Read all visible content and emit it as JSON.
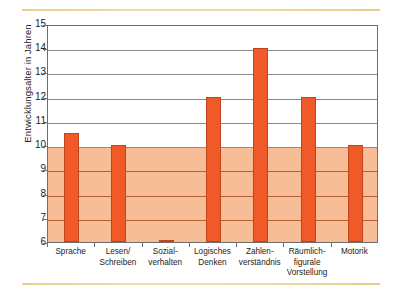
{
  "chart_data": {
    "type": "bar",
    "title": "",
    "xlabel": "",
    "ylabel": "Entwicklungsalter in Jahren",
    "ylim": [
      6,
      15
    ],
    "yticks": [
      6,
      7,
      8,
      9,
      10,
      11,
      12,
      13,
      14,
      15
    ],
    "grid": true,
    "legend": "none",
    "shaded_band": {
      "from": 6,
      "to": 10,
      "color": "#f7bd96"
    },
    "bar_color": "#ef5a28",
    "bar_edge_color": "#c0451c",
    "categories": [
      "Sprache",
      "Lesen/ Schreiben",
      "Sozial- verhalten",
      "Logisches Denken",
      "Zahlen- verständnis",
      "Räumlich- figurale Vorstellung",
      "Motorik"
    ],
    "category_lines": [
      [
        "Sprache"
      ],
      [
        "Lesen/",
        "Schreiben"
      ],
      [
        "Sozial-",
        "verhalten"
      ],
      [
        "Logisches",
        "Denken"
      ],
      [
        "Zahlen-",
        "verständnis"
      ],
      [
        "Räumlich-",
        "figurale",
        "Vorstellung"
      ],
      [
        "Motorik"
      ]
    ],
    "values": [
      10.5,
      10,
      6.1,
      12,
      14,
      12,
      10
    ]
  },
  "decor": {
    "rule_color": "#e8cf8c"
  }
}
